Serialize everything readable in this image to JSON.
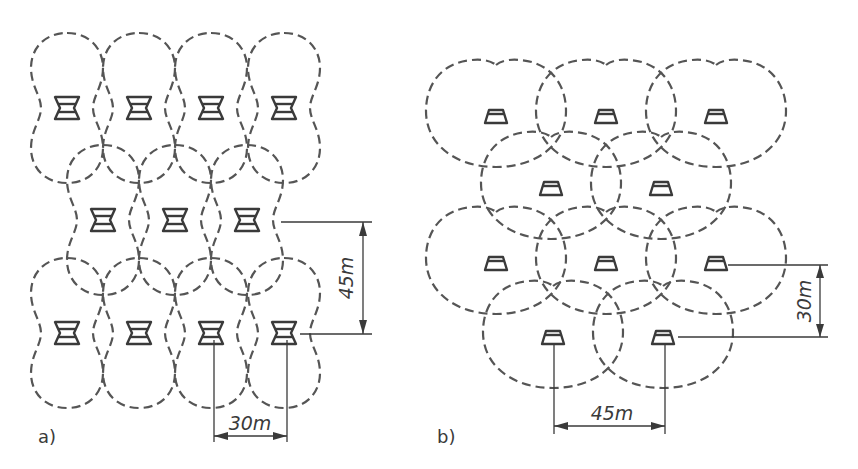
{
  "figure": {
    "panels": [
      {
        "id": "a",
        "label": "a)",
        "speaker_type": "bidirectional",
        "speakers": [
          {
            "x": 67,
            "y": 108
          },
          {
            "x": 139,
            "y": 108
          },
          {
            "x": 211,
            "y": 108
          },
          {
            "x": 284,
            "y": 108
          },
          {
            "x": 103,
            "y": 220
          },
          {
            "x": 175,
            "y": 220
          },
          {
            "x": 247,
            "y": 220
          },
          {
            "x": 67,
            "y": 333
          },
          {
            "x": 139,
            "y": 333
          },
          {
            "x": 211,
            "y": 333
          },
          {
            "x": 284,
            "y": 333
          }
        ],
        "dimensions": [
          {
            "label": "45m",
            "orientation": "vertical"
          },
          {
            "label": "30m",
            "orientation": "horizontal"
          }
        ]
      },
      {
        "id": "b",
        "label": "b)",
        "speaker_type": "unidirectional",
        "speakers": [
          {
            "x": 496,
            "y": 117
          },
          {
            "x": 606,
            "y": 117
          },
          {
            "x": 716,
            "y": 117
          },
          {
            "x": 551,
            "y": 189
          },
          {
            "x": 661,
            "y": 189
          },
          {
            "x": 496,
            "y": 264
          },
          {
            "x": 606,
            "y": 264
          },
          {
            "x": 716,
            "y": 264
          },
          {
            "x": 553,
            "y": 338
          },
          {
            "x": 663,
            "y": 338
          }
        ],
        "dimensions": [
          {
            "label": "30m",
            "orientation": "vertical"
          },
          {
            "label": "45m",
            "orientation": "horizontal"
          }
        ]
      }
    ],
    "colors": {
      "line": "#3a3a3a",
      "lobe": "#555555",
      "background": "#ffffff"
    }
  }
}
